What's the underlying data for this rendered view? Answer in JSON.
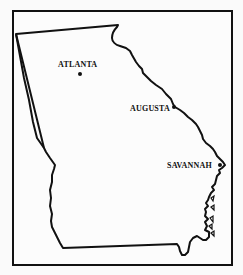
{
  "map": {
    "region": "Georgia",
    "colors": {
      "outline": "#111111",
      "background": "#fcfcfc",
      "text": "#111111"
    },
    "cities": [
      {
        "name": "ATLANTA",
        "label_x": 58,
        "label_y": 60,
        "dot_x": 78,
        "dot_y": 72
      },
      {
        "name": "AUGUSTA",
        "label_x": 130,
        "label_y": 104,
        "dot_x": 172,
        "dot_y": 105
      },
      {
        "name": "SAVANNAH",
        "label_x": 167,
        "label_y": 161,
        "dot_x": 218,
        "dot_y": 163
      }
    ]
  }
}
